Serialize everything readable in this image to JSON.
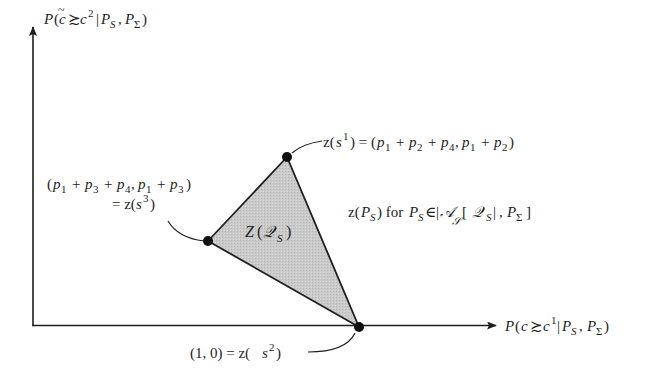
{
  "diagram": {
    "colors": {
      "ink": "#1e1e1e",
      "region_fill": "#c8c8c8",
      "background": "#ffffff"
    },
    "axes": {
      "y_label": "P(c̃ ≿ c² | P_S, P_Σ)",
      "x_label": "P(c ≿ c¹ | P_S, P_Σ)",
      "origin": [
        32,
        325
      ],
      "y_tip": [
        34,
        25
      ],
      "x_tip": [
        497,
        326
      ]
    },
    "region": {
      "label": "Z(𝒬_S)",
      "vertices": [
        [
          287,
          157
        ],
        [
          208,
          241
        ],
        [
          359,
          327
        ]
      ]
    },
    "points": [
      {
        "id": "s1",
        "label": "z(s¹) = (p₁ + p₂ + p₄, p₁ + p₂)",
        "xy": [
          287,
          157
        ]
      },
      {
        "id": "s3",
        "label_line1": "(p₁ + p₃ + p₄, p₁ + p₃)",
        "label_line2": "= z(s³)",
        "xy": [
          208,
          241
        ]
      },
      {
        "id": "s2",
        "label": "(1, 0) = z(s²)",
        "xy": [
          359,
          327
        ]
      }
    ],
    "annotation": "z(P_S) for P_S ∈ |𝒜_𝒮[ 𝒬_S |, P_Σ ]"
  }
}
